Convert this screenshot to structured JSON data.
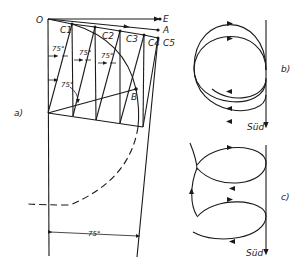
{
  "figure": {
    "panel_a": {
      "label": "a)",
      "points": {
        "O": "O",
        "E": "E",
        "A": "A",
        "B": "B"
      },
      "c_points": [
        "C1",
        "C2",
        "C3",
        "C4",
        "C5"
      ],
      "angle_labels": [
        "75°",
        "75°",
        "75°",
        "75°"
      ],
      "dimension_label": "75°"
    },
    "panel_b": {
      "label": "b)",
      "direction_label": "Süd"
    },
    "panel_c": {
      "label": "c)",
      "direction_label": "Süd"
    }
  }
}
